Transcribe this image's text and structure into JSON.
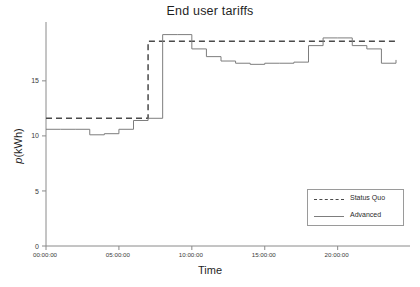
{
  "chart_data": {
    "type": "line",
    "title": "End user tariffs",
    "xlabel": "Time",
    "ylabel": "p(kWh)",
    "ylabel_italic_prefix": "p",
    "ylabel_rest": "(kWh)",
    "xlim": [
      0,
      24
    ],
    "ylim": [
      0,
      19.8
    ],
    "yticks": [
      0,
      5,
      10,
      15
    ],
    "ytick_labels": [
      "0",
      "5",
      "10",
      "15"
    ],
    "xticks": [
      0,
      5,
      10,
      15,
      20
    ],
    "xtick_labels": [
      "00:00:00",
      "05:00:00",
      "10:00:00",
      "15:00:00",
      "20:00:00"
    ],
    "grid": false,
    "legend_position": "lower right",
    "series": [
      {
        "name": "Status Quo",
        "style": "dashed",
        "color": "#4a4a4a",
        "drawstyle": "steps-post",
        "x": [
          0,
          1,
          2,
          3,
          4,
          5,
          6,
          7,
          8,
          9,
          10,
          11,
          12,
          13,
          14,
          15,
          16,
          17,
          18,
          19,
          20,
          21,
          22,
          23,
          24
        ],
        "values": [
          11.6,
          11.6,
          11.6,
          11.6,
          11.6,
          11.6,
          11.6,
          18.6,
          18.6,
          18.6,
          18.6,
          18.6,
          18.6,
          18.6,
          18.6,
          18.6,
          18.6,
          18.6,
          18.6,
          18.6,
          18.6,
          18.6,
          18.6,
          18.6,
          18.6
        ]
      },
      {
        "name": "Advanced",
        "style": "solid",
        "color": "#7d7d7d",
        "drawstyle": "steps-post",
        "x": [
          0,
          1,
          2,
          3,
          4,
          5,
          6,
          7,
          8,
          9,
          10,
          11,
          12,
          13,
          14,
          15,
          16,
          17,
          18,
          19,
          20,
          21,
          22,
          23,
          24
        ],
        "values": [
          10.6,
          10.6,
          10.6,
          10.1,
          10.2,
          10.6,
          11.4,
          11.6,
          19.2,
          19.2,
          17.9,
          17.2,
          16.8,
          16.6,
          16.5,
          16.6,
          16.6,
          16.7,
          18.2,
          18.9,
          18.9,
          18.2,
          17.9,
          16.6,
          16.9
        ]
      }
    ]
  },
  "legend": {
    "items": [
      {
        "label": "Status Quo",
        "style": "dashed"
      },
      {
        "label": "Advanced",
        "style": "solid"
      }
    ]
  }
}
